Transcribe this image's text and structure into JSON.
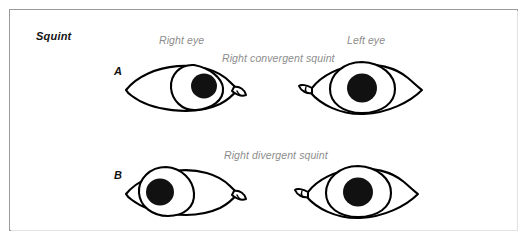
{
  "figure": {
    "title": "Squint",
    "panel_border_color": "#9a9a9a",
    "background_color": "#ffffff",
    "label_color": "#8d8d8d",
    "ink_color": "#000000"
  },
  "columns": [
    {
      "key": "right_eye",
      "label": "Right eye"
    },
    {
      "key": "left_eye",
      "label": "Left eye"
    }
  ],
  "rows": [
    {
      "letter": "A",
      "caption": "Right convergent squint",
      "eyes": [
        {
          "side": "right",
          "icon": "eye-icon",
          "iris_position": "nasal-deviated",
          "caruncle_side": "right"
        },
        {
          "side": "left",
          "icon": "eye-icon",
          "iris_position": "centered",
          "caruncle_side": "left"
        }
      ]
    },
    {
      "letter": "B",
      "caption": "Right divergent squint",
      "eyes": [
        {
          "side": "right",
          "icon": "eye-icon",
          "iris_position": "temporal-deviated",
          "caruncle_side": "right"
        },
        {
          "side": "left",
          "icon": "eye-icon",
          "iris_position": "centered",
          "caruncle_side": "left"
        }
      ]
    }
  ]
}
